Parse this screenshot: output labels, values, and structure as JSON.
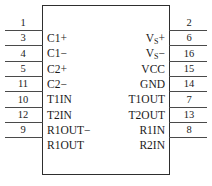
{
  "diagram": {
    "kind": "ic-pinout",
    "body_stroke_color": "#2e2e2e",
    "lead_stroke_color": "#4a4a4a",
    "text_color": "#1b1b1b",
    "background_color": "#ffffff"
  },
  "left_pins": [
    {
      "number": "1",
      "label": "C1+",
      "y": 30
    },
    {
      "number": "3",
      "label": "C1−",
      "y": 45
    },
    {
      "number": "4",
      "label": "C2+",
      "y": 61
    },
    {
      "number": "5",
      "label": "C2−",
      "y": 76
    },
    {
      "number": "11",
      "label": "T1IN",
      "y": 91
    },
    {
      "number": "10",
      "label": "T2IN",
      "y": 107
    },
    {
      "number": "12",
      "label": "R1OUT−",
      "y": 122
    },
    {
      "number": "9",
      "label": "R1OUT",
      "y": 137
    }
  ],
  "right_pins": [
    {
      "number": "2",
      "label": "V",
      "sub": "S",
      "sign": "+",
      "y": 30
    },
    {
      "number": "6",
      "label": "V",
      "sub": "S",
      "sign": "−",
      "y": 45
    },
    {
      "number": "16",
      "label": "VCC",
      "sub": "",
      "sign": "",
      "y": 61
    },
    {
      "number": "15",
      "label": "GND",
      "sub": "",
      "sign": "",
      "y": 76
    },
    {
      "number": "14",
      "label": "T1OUT",
      "sub": "",
      "sign": "",
      "y": 91
    },
    {
      "number": "7",
      "label": "T2OUT",
      "sub": "",
      "sign": "",
      "y": 107
    },
    {
      "number": "13",
      "label": "R1IN",
      "sub": "",
      "sign": "",
      "y": 122
    },
    {
      "number": "8",
      "label": "R2IN",
      "sub": "",
      "sign": "",
      "y": 137
    }
  ]
}
